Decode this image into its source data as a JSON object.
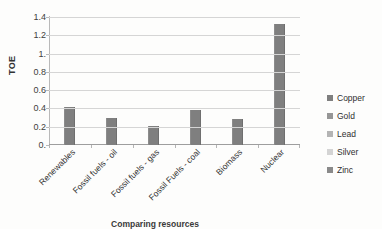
{
  "chart_data": {
    "type": "bar",
    "title": "",
    "xlabel": "Comparing resources",
    "ylabel": "TOE",
    "categories": [
      "Renewables",
      "Fossil fuels - oil",
      "Fossil fuels - gas",
      "Fossil Fuels - coal",
      "Biomass",
      "Nuclear"
    ],
    "values": [
      0.42,
      0.3,
      0.21,
      0.38,
      0.29,
      1.32
    ],
    "ylim": [
      0,
      1.4
    ],
    "ytick_values": [
      0,
      0.2,
      0.4,
      0.6,
      0.8,
      1.0,
      1.2,
      1.4
    ],
    "ytick_labels": [
      "0.",
      "0.2",
      "0.4",
      "0.6",
      "0.8",
      "1.",
      "1.2",
      "1.4"
    ],
    "grid": true,
    "legend_position": "right",
    "series": [
      {
        "name": "Copper",
        "color": "#7f7f7f"
      },
      {
        "name": "Gold",
        "color": "#969696"
      },
      {
        "name": "Lead",
        "color": "#b4b4b4"
      },
      {
        "name": "Silver",
        "color": "#d2d2d2"
      },
      {
        "name": "Zinc",
        "color": "#8a8a8a"
      }
    ],
    "bar_color": "#7f7f7f"
  },
  "legend": {
    "items": [
      {
        "label": "Copper",
        "color": "#7f7f7f"
      },
      {
        "label": "Gold",
        "color": "#969696"
      },
      {
        "label": "Lead",
        "color": "#b4b4b4"
      },
      {
        "label": "Silver",
        "color": "#d4d4d4"
      },
      {
        "label": "Zinc",
        "color": "#8a8a8a"
      }
    ]
  }
}
